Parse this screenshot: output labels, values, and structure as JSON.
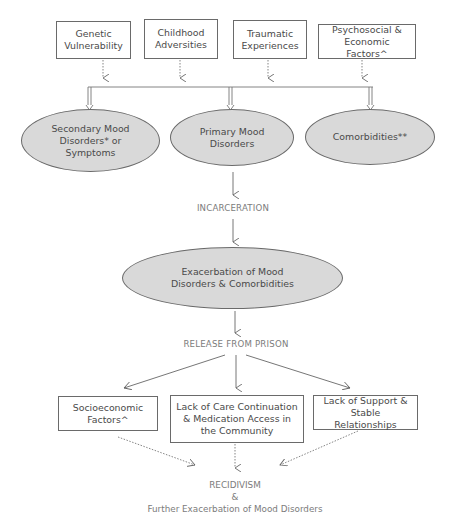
{
  "risk_factors": [
    {
      "label": "Genetic Vulnerability",
      "lines": [
        "Genetic",
        "Vulnerability"
      ]
    },
    {
      "label": "Childhood Adversities",
      "lines": [
        "Childhood",
        "Adversities"
      ]
    },
    {
      "label": "Traumatic Experiences",
      "lines": [
        "Traumatic",
        "Experiences"
      ]
    },
    {
      "label": "Psychosocial & Economic Factors^",
      "lines": [
        "Psychosocial &",
        "Economic Factors^"
      ]
    }
  ],
  "conditions": [
    {
      "label": "Secondary Mood Disorders* or Symptoms",
      "lines": [
        "Secondary Mood",
        "Disorders* or",
        "Symptoms"
      ]
    },
    {
      "label": "Primary Mood Disorders",
      "lines": [
        "Primary Mood",
        "Disorders"
      ]
    },
    {
      "label": "Comorbidities**",
      "lines": [
        "Comorbidities**"
      ]
    }
  ],
  "stage_incarceration": "INCARCERATION",
  "exacerbation": {
    "lines": [
      "Exacerbation of Mood",
      "Disorders & Comorbidities"
    ]
  },
  "stage_release": "RELEASE FROM PRISON",
  "post_release_factors": [
    {
      "label": "Socioeconomic Factors^",
      "lines": [
        "Socioeconomic",
        "Factors^"
      ]
    },
    {
      "label": "Lack of Care Continuation & Medication Access in the Community",
      "lines": [
        "Lack of Care Continuation",
        "& Medication Access in",
        "the Community"
      ]
    },
    {
      "label": "Lack of Support & Stable Relationships",
      "lines": [
        "Lack of Support &",
        "Stable Relationships"
      ]
    }
  ],
  "outcome": {
    "line1": "RECIDIVISM",
    "line2": "&",
    "line3": "Further Exacerbation of Mood Disorders"
  },
  "colors": {
    "box_border": "#6a6a6a",
    "ellipse_fill": "#d9d9d9",
    "text": "#4a4a4a",
    "stage_text": "#7c7c7c",
    "arrow": "#666666"
  }
}
